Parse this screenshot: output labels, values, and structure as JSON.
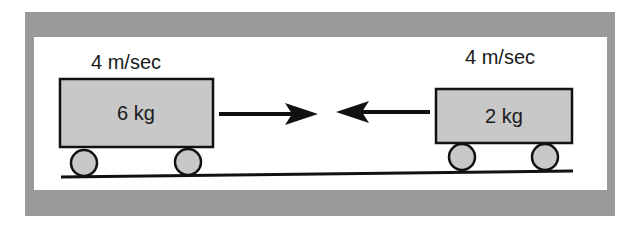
{
  "diagram": {
    "title": "",
    "colors": {
      "frame": "#9a9a9a",
      "background": "#ffffff",
      "cart_fill": "#c8c8c8",
      "stroke": "#111111"
    },
    "carts": [
      {
        "id": "left-cart",
        "mass_label": "6 kg",
        "velocity_label": "4 m/sec",
        "direction": "right"
      },
      {
        "id": "right-cart",
        "mass_label": "2 kg",
        "velocity_label": "4 m/sec",
        "direction": "left"
      }
    ],
    "arrows": [
      {
        "id": "arrow-right",
        "direction": "right"
      },
      {
        "id": "arrow-left",
        "direction": "left"
      }
    ],
    "ground": {
      "present": true
    }
  }
}
